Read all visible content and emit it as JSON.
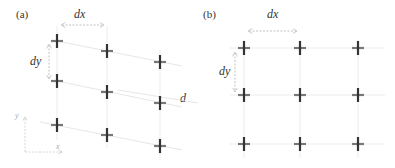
{
  "figure": {
    "panels": [
      {
        "id": "a",
        "label": "(a)",
        "dx_label": "dx",
        "dy_label": "dy",
        "d_label": "d",
        "axis": {
          "x_label": "x",
          "y_label": "y"
        },
        "description": "Sheared grid of markers: columns vertical, rows tilted downward by offset d"
      },
      {
        "id": "b",
        "label": "(b)",
        "dx_label": "dx",
        "dy_label": "dy",
        "description": "Regular rectangular 3x3 grid of markers"
      }
    ],
    "colors": {
      "marker": "#444444",
      "marker_accent": "#888888",
      "grid_line": "#dddddd",
      "arrow": "#bbbbbb",
      "text": "#333333"
    }
  }
}
